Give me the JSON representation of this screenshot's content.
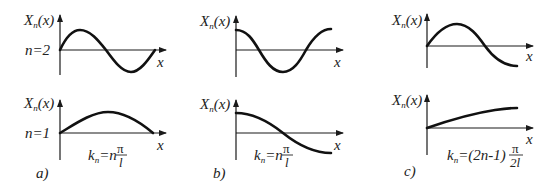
{
  "figure": {
    "panels": [
      {
        "id": "a",
        "caption": "a)",
        "formula": {
          "k": "k",
          "sub": "n",
          "eq": "=n",
          "num": "π",
          "den": "l",
          "full": "k_n = n π / l"
        },
        "plots": [
          {
            "ylabel": "X",
            "ylabel_sub": "n",
            "ylabel_arg": "(x)",
            "xlabel": "x",
            "mode_label": "n=2",
            "shape": "sin(2πx/l)"
          },
          {
            "ylabel": "X",
            "ylabel_sub": "n",
            "ylabel_arg": "(x)",
            "xlabel": "x",
            "mode_label": "n=1",
            "shape": "sin(πx/l)"
          }
        ]
      },
      {
        "id": "b",
        "caption": "b)",
        "formula": {
          "k": "k",
          "sub": "n",
          "eq": "=n",
          "num": "π",
          "den": "l",
          "full": "k_n = n π / l"
        },
        "plots": [
          {
            "ylabel": "X",
            "ylabel_sub": "n",
            "ylabel_arg": "(x)",
            "xlabel": "x",
            "shape": "cos(2πx/l)"
          },
          {
            "ylabel": "X",
            "ylabel_sub": "n",
            "ylabel_arg": "(x)",
            "xlabel": "x",
            "shape": "cos(πx/l)"
          }
        ]
      },
      {
        "id": "c",
        "caption": "c)",
        "formula": {
          "k": "k",
          "sub": "n",
          "eq": "=(2n-1)",
          "num": "π",
          "den": "2l",
          "full": "k_n = (2n-1) π / 2l"
        },
        "plots": [
          {
            "ylabel": "X",
            "ylabel_sub": "n",
            "ylabel_arg": "(x)",
            "xlabel": "x",
            "shape": "sin(3πx/2l)"
          },
          {
            "ylabel": "X",
            "ylabel_sub": "n",
            "ylabel_arg": "(x)",
            "xlabel": "x",
            "shape": "sin(πx/2l)"
          }
        ]
      }
    ],
    "colors": {
      "ink": "#111111",
      "background": "#ffffff"
    }
  }
}
